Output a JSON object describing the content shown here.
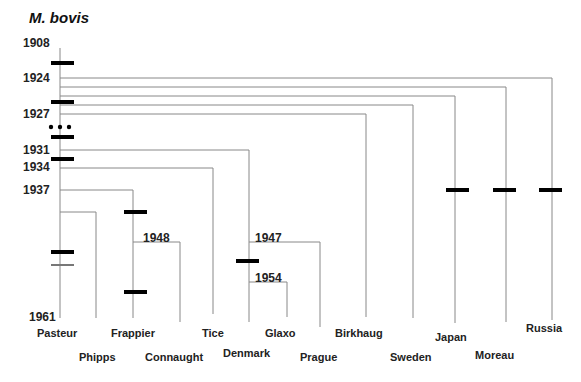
{
  "title": "M. bovis",
  "colors": {
    "line": "#888888",
    "marker": "#000000",
    "text": "#222222"
  },
  "years": [
    {
      "label": "1908",
      "x": 23,
      "y": 36
    },
    {
      "label": "1924",
      "x": 23,
      "y": 71
    },
    {
      "label": "1927",
      "x": 23,
      "y": 107
    },
    {
      "label": "1931",
      "x": 23,
      "y": 143
    },
    {
      "label": "1934",
      "x": 23,
      "y": 160
    },
    {
      "label": "1937",
      "x": 23,
      "y": 183
    },
    {
      "label": "1948",
      "x": 143,
      "y": 231
    },
    {
      "label": "1947",
      "x": 255,
      "y": 231
    },
    {
      "label": "1954",
      "x": 255,
      "y": 271
    },
    {
      "label": "1961",
      "x": 29,
      "y": 310
    }
  ],
  "strains": [
    {
      "label": "Pasteur",
      "x": 37,
      "y": 327
    },
    {
      "label": "Phipps",
      "x": 79,
      "y": 351
    },
    {
      "label": "Frappier",
      "x": 111,
      "y": 327
    },
    {
      "label": "Connaught",
      "x": 145,
      "y": 351
    },
    {
      "label": "Tice",
      "x": 202,
      "y": 327
    },
    {
      "label": "Denmark",
      "x": 223,
      "y": 347
    },
    {
      "label": "Glaxo",
      "x": 265,
      "y": 327
    },
    {
      "label": "Prague",
      "x": 300,
      "y": 351
    },
    {
      "label": "Birkhaug",
      "x": 335,
      "y": 327
    },
    {
      "label": "Sweden",
      "x": 390,
      "y": 351
    },
    {
      "label": "Japan",
      "x": 435,
      "y": 331
    },
    {
      "label": "Moreau",
      "x": 475,
      "y": 349
    },
    {
      "label": "Russia",
      "x": 526,
      "y": 322
    }
  ],
  "lines": [
    {
      "x1": 60,
      "y1": 48,
      "x2": 60,
      "y2": 318
    },
    {
      "x1": 60,
      "y1": 78,
      "x2": 552,
      "y2": 78
    },
    {
      "x1": 552,
      "y1": 78,
      "x2": 552,
      "y2": 320
    },
    {
      "x1": 60,
      "y1": 87,
      "x2": 506,
      "y2": 87
    },
    {
      "x1": 506,
      "y1": 87,
      "x2": 506,
      "y2": 322
    },
    {
      "x1": 60,
      "y1": 96,
      "x2": 455,
      "y2": 96
    },
    {
      "x1": 455,
      "y1": 96,
      "x2": 455,
      "y2": 323
    },
    {
      "x1": 60,
      "y1": 105,
      "x2": 413,
      "y2": 105
    },
    {
      "x1": 413,
      "y1": 105,
      "x2": 413,
      "y2": 318
    },
    {
      "x1": 60,
      "y1": 114,
      "x2": 366,
      "y2": 114
    },
    {
      "x1": 366,
      "y1": 114,
      "x2": 366,
      "y2": 317
    },
    {
      "x1": 60,
      "y1": 150,
      "x2": 249,
      "y2": 150
    },
    {
      "x1": 249,
      "y1": 150,
      "x2": 249,
      "y2": 322
    },
    {
      "x1": 60,
      "y1": 168,
      "x2": 213,
      "y2": 168
    },
    {
      "x1": 213,
      "y1": 168,
      "x2": 213,
      "y2": 314
    },
    {
      "x1": 60,
      "y1": 190,
      "x2": 133,
      "y2": 190
    },
    {
      "x1": 133,
      "y1": 190,
      "x2": 133,
      "y2": 318
    },
    {
      "x1": 60,
      "y1": 212,
      "x2": 96,
      "y2": 212
    },
    {
      "x1": 96,
      "y1": 212,
      "x2": 96,
      "y2": 318
    },
    {
      "x1": 133,
      "y1": 242,
      "x2": 180,
      "y2": 242
    },
    {
      "x1": 180,
      "y1": 242,
      "x2": 180,
      "y2": 322
    },
    {
      "x1": 249,
      "y1": 242,
      "x2": 320,
      "y2": 242
    },
    {
      "x1": 320,
      "y1": 242,
      "x2": 320,
      "y2": 327
    },
    {
      "x1": 249,
      "y1": 282,
      "x2": 287,
      "y2": 282
    },
    {
      "x1": 287,
      "y1": 282,
      "x2": 287,
      "y2": 317
    }
  ],
  "markers": [
    {
      "x": 51,
      "y": 61,
      "w": 23,
      "h": 4,
      "color": "#000"
    },
    {
      "x": 51,
      "y": 100,
      "w": 23,
      "h": 4,
      "color": "#000"
    },
    {
      "x": 51,
      "y": 135,
      "w": 23,
      "h": 4,
      "color": "#000"
    },
    {
      "x": 51,
      "y": 157,
      "w": 23,
      "h": 4,
      "color": "#000"
    },
    {
      "x": 51,
      "y": 250,
      "w": 23,
      "h": 4,
      "color": "#000"
    },
    {
      "x": 51,
      "y": 264,
      "w": 23,
      "h": 2,
      "color": "#777"
    },
    {
      "x": 124,
      "y": 210,
      "w": 23,
      "h": 4,
      "color": "#000"
    },
    {
      "x": 124,
      "y": 290,
      "w": 23,
      "h": 4,
      "color": "#000"
    },
    {
      "x": 236,
      "y": 259,
      "w": 23,
      "h": 4,
      "color": "#000"
    },
    {
      "x": 446,
      "y": 188,
      "w": 23,
      "h": 4,
      "color": "#000"
    },
    {
      "x": 493,
      "y": 188,
      "w": 23,
      "h": 4,
      "color": "#000"
    },
    {
      "x": 539,
      "y": 188,
      "w": 23,
      "h": 4,
      "color": "#000"
    }
  ],
  "ellipsis_dots": [
    {
      "x": 51,
      "y": 127
    },
    {
      "x": 60,
      "y": 127
    },
    {
      "x": 69,
      "y": 127
    }
  ]
}
